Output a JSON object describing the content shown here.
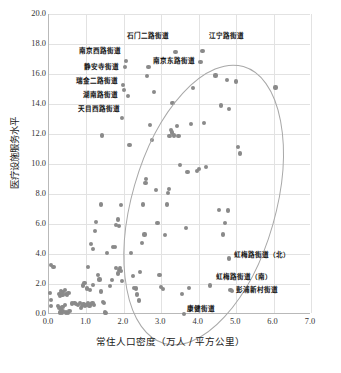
{
  "chart_data": {
    "type": "scatter",
    "title": "",
    "xlabel": "常住人口密度（万人 / 平方公里）",
    "ylabel": "医疗设施服务水平",
    "xlim": [
      0.0,
      7.0
    ],
    "ylim": [
      0.0,
      20.0
    ],
    "xticks": [
      "0.0",
      "1.0",
      "2.0",
      "3.0",
      "4.0",
      "5.0",
      "6.0",
      "7.0"
    ],
    "yticks": [
      "0.0",
      "2.0",
      "4.0",
      "6.0",
      "8.0",
      "10.0",
      "12.0",
      "14.0",
      "16.0",
      "18.0",
      "20.0"
    ],
    "grid": true,
    "legend": "none",
    "marker_color": "#8a8a8a",
    "ellipse_color": "#a8a8a8",
    "points": [
      [
        0.05,
        3.25
      ],
      [
        0.12,
        3.15
      ],
      [
        0.02,
        1.4
      ],
      [
        0.05,
        0.95
      ],
      [
        0.05,
        0.55
      ],
      [
        0.28,
        1.35
      ],
      [
        0.32,
        1.55
      ],
      [
        0.38,
        1.45
      ],
      [
        0.42,
        1.6
      ],
      [
        0.45,
        1.35
      ],
      [
        0.3,
        1.2
      ],
      [
        0.36,
        1.25
      ],
      [
        0.48,
        1.25
      ],
      [
        0.52,
        1.4
      ],
      [
        0.25,
        0.55
      ],
      [
        0.28,
        0.42
      ],
      [
        0.32,
        0.3
      ],
      [
        0.3,
        0.1
      ],
      [
        0.34,
        0.05
      ],
      [
        0.38,
        0.2
      ],
      [
        0.36,
        0.45
      ],
      [
        0.42,
        0.62
      ],
      [
        0.45,
        0.1
      ],
      [
        0.5,
        0.08
      ],
      [
        0.55,
        0.18
      ],
      [
        0.62,
        0.7
      ],
      [
        0.68,
        0.72
      ],
      [
        0.72,
        0.65
      ],
      [
        0.78,
        0.58
      ],
      [
        0.82,
        0.72
      ],
      [
        0.85,
        0.4
      ],
      [
        0.88,
        0.52
      ],
      [
        0.92,
        0.68
      ],
      [
        0.96,
        0.55
      ],
      [
        1.0,
        0.62
      ],
      [
        1.05,
        0.7
      ],
      [
        1.08,
        0.52
      ],
      [
        1.12,
        0.65
      ],
      [
        1.16,
        0.75
      ],
      [
        1.2,
        0.6
      ],
      [
        0.9,
        1.9
      ],
      [
        0.95,
        2.05
      ],
      [
        1.02,
        1.7
      ],
      [
        1.1,
        1.6
      ],
      [
        1.18,
        1.95
      ],
      [
        1.05,
        3.15
      ],
      [
        1.12,
        4.65
      ],
      [
        1.18,
        4.35
      ],
      [
        1.22,
        5.55
      ],
      [
        1.25,
        6.15
      ],
      [
        1.3,
        2.6
      ],
      [
        1.35,
        2.3
      ],
      [
        1.4,
        1.5
      ],
      [
        1.44,
        0.8
      ],
      [
        1.48,
        0.75
      ],
      [
        1.5,
        0.1
      ],
      [
        1.52,
        0.08
      ],
      [
        1.38,
        7.3
      ],
      [
        1.42,
        11.9
      ],
      [
        1.55,
        4.05
      ],
      [
        1.62,
        1.85
      ],
      [
        1.68,
        2.25
      ],
      [
        1.72,
        4.45
      ],
      [
        1.76,
        4.45
      ],
      [
        1.8,
        3.05
      ],
      [
        1.85,
        2.7
      ],
      [
        1.88,
        2.95
      ],
      [
        1.9,
        3.05
      ],
      [
        1.92,
        2.85
      ],
      [
        1.95,
        2.2
      ],
      [
        1.8,
        5.95
      ],
      [
        1.84,
        6.3
      ],
      [
        1.88,
        5.85
      ],
      [
        1.92,
        7.25
      ],
      [
        1.95,
        13.05
      ],
      [
        1.98,
        15.25
      ],
      [
        2.0,
        14.95
      ],
      [
        2.02,
        16.45
      ],
      [
        2.05,
        16.85
      ],
      [
        2.1,
        14.55
      ],
      [
        2.15,
        11.25
      ],
      [
        2.2,
        4.05
      ],
      [
        2.25,
        2.55
      ],
      [
        2.28,
        1.75
      ],
      [
        2.32,
        1.7
      ],
      [
        2.36,
        1.3
      ],
      [
        2.4,
        0.9
      ],
      [
        2.44,
        2.8
      ],
      [
        2.48,
        4.75
      ],
      [
        2.52,
        7.3
      ],
      [
        2.55,
        5.3
      ],
      [
        2.58,
        8.75
      ],
      [
        2.6,
        9.0
      ],
      [
        2.62,
        15.85
      ],
      [
        2.66,
        16.45
      ],
      [
        2.7,
        12.6
      ],
      [
        2.75,
        11.6
      ],
      [
        2.8,
        14.8
      ],
      [
        2.85,
        8.25
      ],
      [
        2.9,
        6.05
      ],
      [
        2.95,
        2.6
      ],
      [
        3.0,
        1.8
      ],
      [
        3.05,
        1.65
      ],
      [
        3.1,
        5.25
      ],
      [
        3.15,
        7.3
      ],
      [
        3.18,
        8.05
      ],
      [
        3.2,
        8.35
      ],
      [
        3.22,
        11.85
      ],
      [
        3.25,
        12.25
      ],
      [
        3.28,
        12.1
      ],
      [
        3.3,
        14.05
      ],
      [
        3.34,
        11.9
      ],
      [
        3.38,
        17.45
      ],
      [
        3.42,
        12.55
      ],
      [
        3.46,
        11.85
      ],
      [
        3.5,
        9.95
      ],
      [
        3.55,
        1.35
      ],
      [
        3.6,
        0.02
      ],
      [
        3.65,
        5.75
      ],
      [
        3.7,
        9.45
      ],
      [
        3.75,
        1.75
      ],
      [
        3.8,
        12.65
      ],
      [
        3.85,
        15.05
      ],
      [
        3.95,
        9.55
      ],
      [
        4.0,
        9.65
      ],
      [
        4.05,
        16.8
      ],
      [
        4.1,
        17.55
      ],
      [
        4.15,
        12.75
      ],
      [
        4.2,
        9.8
      ],
      [
        4.3,
        1.9
      ],
      [
        4.45,
        15.9
      ],
      [
        4.55,
        6.95
      ],
      [
        4.6,
        13.9
      ],
      [
        4.65,
        5.3
      ],
      [
        4.7,
        6.05
      ],
      [
        4.75,
        15.6
      ],
      [
        4.78,
        6.9
      ],
      [
        4.8,
        13.65
      ],
      [
        4.82,
        3.7
      ],
      [
        4.85,
        1.6
      ],
      [
        4.88,
        1.55
      ],
      [
        5.0,
        15.5
      ],
      [
        5.05,
        11.15
      ],
      [
        5.1,
        10.7
      ],
      [
        6.05,
        15.1
      ]
    ],
    "annotations": [
      {
        "label": "石门二路街道",
        "x": 3.38,
        "y": 17.45,
        "align": "right",
        "lx": 3.22,
        "ly": 18.55
      },
      {
        "label": "江宁路街道",
        "x": 4.1,
        "y": 17.55,
        "align": "left",
        "lx": 4.3,
        "ly": 18.55
      },
      {
        "label": "南京西路街道",
        "x": 2.05,
        "y": 16.85,
        "align": "right",
        "lx": 1.96,
        "ly": 17.55
      },
      {
        "label": "南京东路街道",
        "x": 2.66,
        "y": 16.45,
        "align": "left",
        "lx": 2.8,
        "ly": 16.85
      },
      {
        "label": "静安寺街道",
        "x": 2.02,
        "y": 16.45,
        "align": "right",
        "lx": 1.9,
        "ly": 16.5
      },
      {
        "label": "瑞金二路街道",
        "x": 1.98,
        "y": 15.25,
        "align": "right",
        "lx": 1.88,
        "ly": 15.55
      },
      {
        "label": "湖南路街道",
        "x": 2.0,
        "y": 14.95,
        "align": "right",
        "lx": 1.86,
        "ly": 14.6
      },
      {
        "label": "天目西路街道",
        "x": 2.1,
        "y": 14.55,
        "align": "right",
        "lx": 1.92,
        "ly": 13.7
      },
      {
        "label": "虹梅路街道（北）",
        "x": 4.82,
        "y": 3.7,
        "align": "left",
        "lx": 4.98,
        "ly": 3.95
      },
      {
        "label": "虹梅路街道（南）",
        "x": 4.3,
        "y": 1.9,
        "align": "left",
        "lx": 4.48,
        "ly": 2.45
      },
      {
        "label": "彭浦新村街道",
        "x": 4.88,
        "y": 1.55,
        "align": "left",
        "lx": 5.02,
        "ly": 1.6
      },
      {
        "label": "康健街道",
        "x": 3.6,
        "y": 0.02,
        "align": "left",
        "lx": 3.72,
        "ly": 0.35
      }
    ],
    "ellipse": {
      "cx": 2.85,
      "cy": 8.2,
      "rx": 1.92,
      "ry": 9.6,
      "rotation_deg": 16
    }
  },
  "caption": ""
}
